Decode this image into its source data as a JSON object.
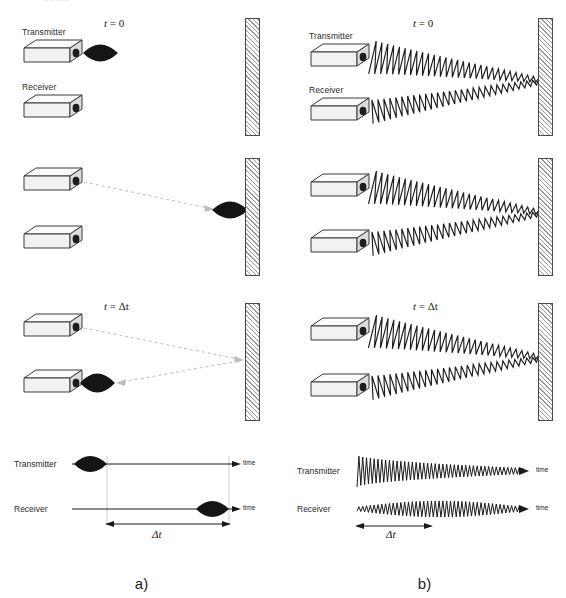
{
  "figure": {
    "type": "scientific-diagram",
    "panels": [
      {
        "id": "a",
        "caption": "a)",
        "method": "pulse-echo",
        "scenes": [
          {
            "time_label_tex": "t = 0",
            "time_var": "t",
            "time_value": "0",
            "transmitter_label": "Transmitter",
            "receiver_label": "Receiver",
            "pulse_position": "at-transmitter",
            "trajectory": "none"
          },
          {
            "time_label_tex": "",
            "time_var": "",
            "time_value": "",
            "transmitter_label": "",
            "receiver_label": "",
            "pulse_position": "at-wall",
            "trajectory": "outgoing"
          },
          {
            "time_label_tex": "t = Δt",
            "time_var": "t",
            "time_value": "Δt",
            "transmitter_label": "",
            "receiver_label": "",
            "pulse_position": "at-receiver",
            "trajectory": "outgoing-and-return"
          }
        ],
        "timing": {
          "rows": [
            {
              "label": "Transmitter",
              "axis_label": "time",
              "burst": "early",
              "burst_center_pct": 22
            },
            {
              "label": "Receiver",
              "axis_label": "time",
              "burst": "late",
              "burst_center_pct": 80
            }
          ],
          "interval_label": "Δt"
        }
      },
      {
        "id": "b",
        "caption": "b)",
        "method": "continuous-wave",
        "scenes": [
          {
            "time_label_tex": "t = 0",
            "time_var": "t",
            "time_value": "0",
            "transmitter_label": "Transmitter",
            "receiver_label": "Receiver",
            "beam": "converging-to-wall"
          },
          {
            "time_label_tex": "",
            "time_var": "",
            "time_value": "",
            "transmitter_label": "",
            "receiver_label": "",
            "beam": "converging-to-wall"
          },
          {
            "time_label_tex": "t = Δt",
            "time_var": "t",
            "time_value": "Δt",
            "transmitter_label": "",
            "receiver_label": "",
            "beam": "converging-to-wall"
          }
        ],
        "timing": {
          "rows": [
            {
              "label": "Transmitter",
              "axis_label": "time",
              "envelope": "decaying"
            },
            {
              "label": "Receiver",
              "axis_label": "time",
              "envelope": "lens"
            }
          ],
          "interval_label": "Δt"
        }
      }
    ],
    "colors": {
      "ink": "#1a1a1a",
      "pulse_fill": "#151515",
      "wall_hatch": "#9a9a9a",
      "wall_outline": "#4a4a4a",
      "box_face": "#f2f2f2",
      "box_outline": "#3a3a3a",
      "trajectory": "#b9b9b9",
      "guide": "#c9c9c9"
    }
  }
}
